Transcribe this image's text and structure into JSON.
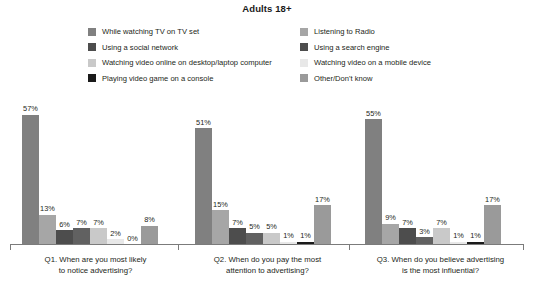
{
  "chart_data": {
    "type": "bar",
    "title": "Adults 18+",
    "xlabel": "",
    "ylabel": "",
    "ylim": [
      0,
      60
    ],
    "grid": false,
    "legend_position": "top",
    "categories": [
      "Q1. When are you most likely to notice advertising?",
      "Q2. When do you pay the most attention to advertising?",
      "Q3. When do you believe advertising is the most influential?"
    ],
    "series": [
      {
        "name": "While watching TV on TV set",
        "color": "#808080",
        "values": [
          57,
          51,
          55
        ]
      },
      {
        "name": "Listening to Radio",
        "color": "#a6a6a6",
        "values": [
          13,
          15,
          9
        ]
      },
      {
        "name": "Using a social network",
        "color": "#4d4d4d",
        "values": [
          6,
          7,
          7
        ]
      },
      {
        "name": "Using a search engine",
        "color": "#616161",
        "values": [
          7,
          5,
          3
        ]
      },
      {
        "name": "Watching video online on desktop/laptop computer",
        "color": "#c9c9c9",
        "values": [
          7,
          5,
          7
        ]
      },
      {
        "name": "Watching video on a mobile device",
        "color": "#e8e8e8",
        "values": [
          2,
          1,
          1
        ]
      },
      {
        "name": "Playing video game on a console",
        "color": "#1a1a1a",
        "values": [
          0,
          1,
          1
        ]
      },
      {
        "name": "Other/Don't know",
        "color": "#9a9a9a",
        "values": [
          8,
          17,
          17
        ]
      }
    ],
    "value_labels": [
      [
        "57%",
        "13%",
        "6%",
        "7%",
        "7%",
        "2%",
        "0%",
        "8%"
      ],
      [
        "51%",
        "15%",
        "7%",
        "5%",
        "5%",
        "1%",
        "1%",
        "17%"
      ],
      [
        "55%",
        "9%",
        "7%",
        "3%",
        "7%",
        "1%",
        "1%",
        "17%"
      ]
    ]
  },
  "legend": {
    "left_column": [
      {
        "label": "While watching TV on TV set",
        "color": "#808080"
      },
      {
        "label": "Using a social network",
        "color": "#4d4d4d"
      },
      {
        "label": "Watching video online on desktop/laptop computer",
        "color": "#c9c9c9"
      },
      {
        "label": "Playing video game on a console",
        "color": "#1a1a1a"
      }
    ],
    "right_column": [
      {
        "label": "Listening to Radio",
        "color": "#a6a6a6"
      },
      {
        "label": "Using a search engine",
        "color": "#4d4d4d"
      },
      {
        "label": "Watching video on a mobile device",
        "color": "#e8e8e8"
      },
      {
        "label": "Other/Don't know",
        "color": "#9a9a9a"
      }
    ]
  },
  "category_labels": [
    {
      "line1": "Q1. When are you most likely",
      "line2": "to notice advertising?"
    },
    {
      "line1": "Q2. When do you pay the most",
      "line2": "attention to advertising?"
    },
    {
      "line1": "Q3. When do you believe advertising",
      "line2": "is the most influential?"
    }
  ],
  "axis": {
    "line_color": "#7b7b7b"
  }
}
